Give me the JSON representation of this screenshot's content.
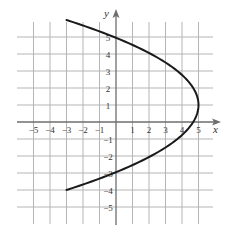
{
  "chart_data": {
    "type": "line",
    "title": "",
    "xlabel": "x",
    "ylabel": "y",
    "xlim": [
      -6,
      6
    ],
    "ylim": [
      -6,
      6
    ],
    "grid": true,
    "legend": null,
    "x_ticks": [
      -5,
      -4,
      -3,
      -2,
      -1,
      1,
      2,
      3,
      4,
      5
    ],
    "y_ticks": [
      5,
      4,
      3,
      2,
      1,
      -1,
      -2,
      -3,
      -4,
      -5
    ],
    "x_tick_labels": [
      "−5",
      "−4",
      "−3",
      "−2",
      "−1",
      "1",
      "2",
      "3",
      "4",
      "5"
    ],
    "y_tick_labels": [
      "5",
      "4",
      "3",
      "2",
      "1",
      "−1",
      "−2",
      "−3",
      "−4",
      "−5"
    ],
    "series": [
      {
        "name": "parabola",
        "equation": "x = 5 - 0.32(y - 1)^2",
        "vertex": [
          5,
          1
        ],
        "opens": "left",
        "endpoints": [
          [
            -3,
            6
          ],
          [
            -3,
            -4
          ]
        ],
        "y_intercepts": [
          5,
          -3
        ],
        "x_intercept": [
          4.68,
          0
        ],
        "points": [
          {
            "x": -3,
            "y": 6
          },
          {
            "x": 0,
            "y": 5
          },
          {
            "x": 2.12,
            "y": 4
          },
          {
            "x": 3.72,
            "y": 3
          },
          {
            "x": 4.68,
            "y": 2
          },
          {
            "x": 5,
            "y": 1
          },
          {
            "x": 4.68,
            "y": 0
          },
          {
            "x": 3.72,
            "y": -1
          },
          {
            "x": 2.12,
            "y": -2
          },
          {
            "x": 0,
            "y": -3
          },
          {
            "x": -3,
            "y": -4
          }
        ],
        "color": "#1a1a1a"
      }
    ]
  },
  "axes": {
    "x_label": "x",
    "y_label": "y"
  },
  "colors": {
    "grid": "#b5b5b5",
    "axis": "#6e6e6e",
    "curve": "#1a1a1a",
    "background": "#ffffff"
  }
}
